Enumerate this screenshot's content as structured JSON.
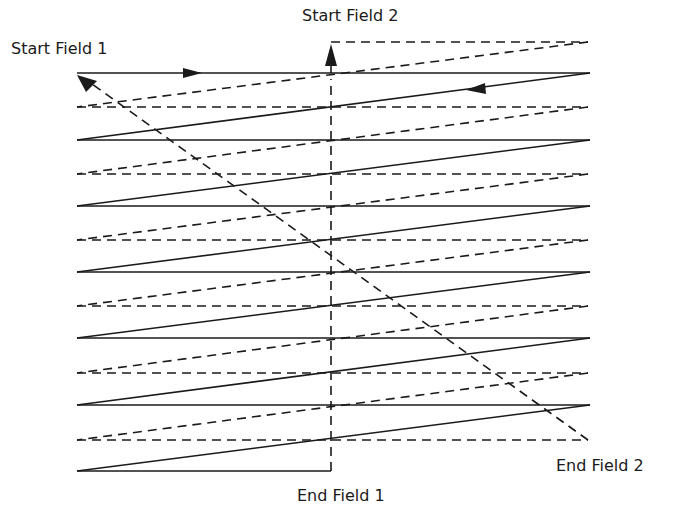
{
  "diagram": {
    "labels": {
      "start_field_1": "Start Field 1",
      "start_field_2": "Start Field 2",
      "end_field_1": "End Field 1",
      "end_field_2": "End Field 2"
    },
    "geometry": {
      "left_x": 77,
      "right_x": 590,
      "mid_x": 331,
      "field1_solid_y": [
        73,
        140,
        206,
        272,
        338,
        405,
        471
      ],
      "field2_dashed_y": [
        42,
        107,
        174,
        240,
        306,
        373,
        440
      ]
    },
    "colors": {
      "stroke": "#1a1a1a",
      "background": "#ffffff"
    },
    "styles": {
      "field1": "solid",
      "field2": "dashed",
      "retrace": "dashed"
    }
  }
}
